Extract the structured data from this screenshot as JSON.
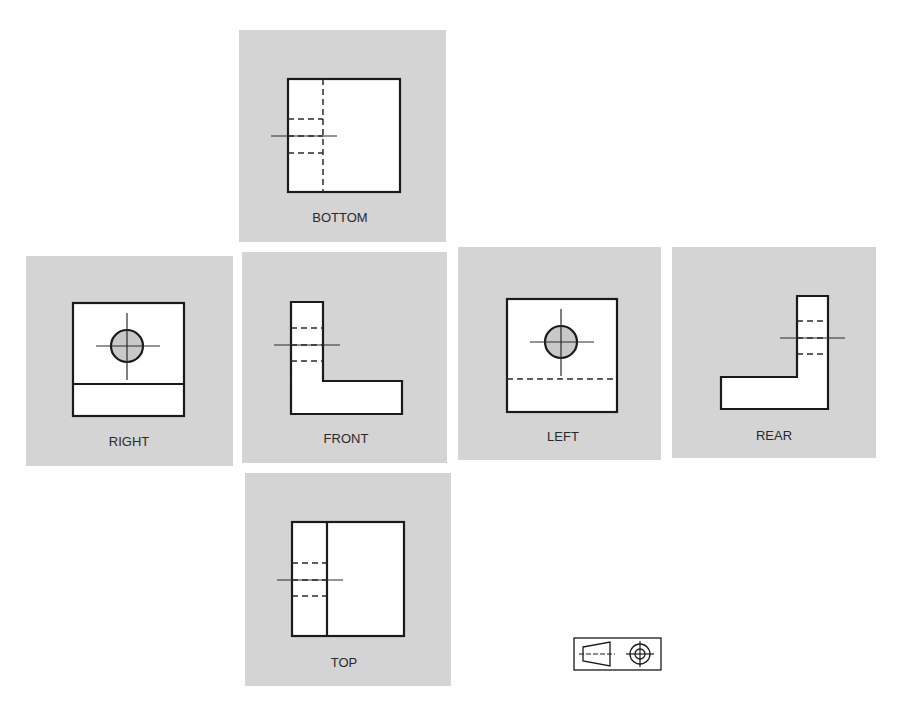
{
  "figure": {
    "views": [
      {
        "id": "bottom",
        "label": "BOTTOM"
      },
      {
        "id": "right",
        "label": "RIGHT"
      },
      {
        "id": "front",
        "label": "FRONT"
      },
      {
        "id": "left",
        "label": "LEFT"
      },
      {
        "id": "rear",
        "label": "REAR"
      },
      {
        "id": "top",
        "label": "TOP"
      }
    ],
    "projection_symbol": "third-angle-projection-symbol"
  },
  "colors": {
    "panel": "#d4d4d4",
    "line": "#1a1a1a",
    "hole_fill": "#c8c8c8",
    "background": "#ffffff"
  }
}
